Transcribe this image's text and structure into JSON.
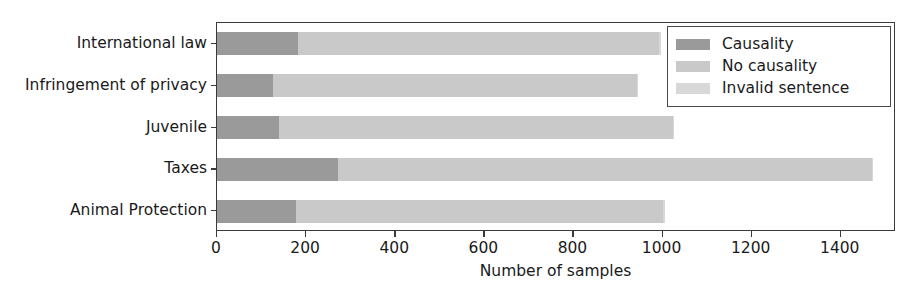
{
  "chart_data": {
    "type": "bar",
    "orientation": "horizontal",
    "stacked": true,
    "title": "",
    "xlabel": "Number of samples",
    "ylabel": "",
    "xlim": [
      0,
      1524
    ],
    "xticks": [
      0,
      200,
      400,
      600,
      800,
      1000,
      1200,
      1400
    ],
    "xtick_labels": [
      "0",
      "200",
      "400",
      "600",
      "800",
      "1000",
      "1200",
      "1400"
    ],
    "grid": false,
    "legend_position": "upper right",
    "categories": [
      "International law",
      "Infringement of privacy",
      "Juvenile",
      "Taxes",
      "Animal Protection"
    ],
    "series": [
      {
        "name": "Causality",
        "color": "#9a9a9a",
        "values": [
          182,
          126,
          139,
          272,
          177
        ]
      },
      {
        "name": "No causality",
        "color": "#c9c9c9",
        "values": [
          810,
          817,
          885,
          1198,
          825
        ]
      },
      {
        "name": "Invalid sentence",
        "color": "#d8d8d8",
        "values": [
          5,
          2,
          2,
          2,
          4
        ]
      }
    ],
    "totals": [
      997,
      945,
      1026,
      1472,
      1006
    ]
  },
  "legend": {
    "items": [
      {
        "label": "Causality",
        "swatch": "causality-swatch"
      },
      {
        "label": "No causality",
        "swatch": "no-causality-swatch"
      },
      {
        "label": "Invalid sentence",
        "swatch": "invalid-sentence-swatch"
      }
    ]
  },
  "colors": {
    "causality": "#9a9a9a",
    "no_causality": "#c9c9c9",
    "invalid_sentence": "#d8d8d8",
    "axis": "#3a3a3a",
    "text": "#1a1a1a",
    "background": "#ffffff"
  }
}
